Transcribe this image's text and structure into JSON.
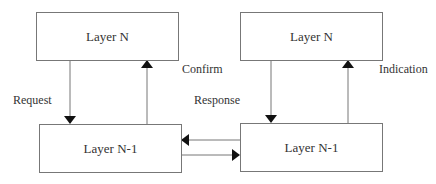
{
  "diagram": {
    "left": {
      "top_box": "Layer N",
      "bottom_box": "Layer N-1",
      "down_arrow_label": "Request",
      "up_arrow_label": "Confirm"
    },
    "right": {
      "top_box": "Layer N",
      "bottom_box": "Layer N-1",
      "up_arrow_label": "Indication"
    },
    "middle_label": "Response",
    "colors": {
      "line": "#777777",
      "arrowhead": "#111111",
      "text": "#333333"
    }
  }
}
